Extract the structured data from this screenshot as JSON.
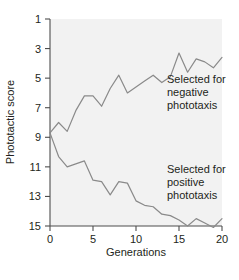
{
  "chart_data": {
    "type": "line",
    "title": "",
    "subtitle": "",
    "xlabel": "Generations",
    "ylabel": "Phototactic score",
    "xlim": [
      0,
      20
    ],
    "ylim": [
      1,
      15
    ],
    "y_axis_inverted": true,
    "grid": false,
    "legend_position": "inline-annotations",
    "xticks": [
      0,
      5,
      10,
      15,
      20
    ],
    "xticklabels": [
      "0",
      "5",
      "10",
      "15",
      "20"
    ],
    "yticks": [
      1,
      3,
      5,
      7,
      9,
      11,
      13,
      15
    ],
    "yticklabels": [
      "1",
      "3",
      "5",
      "7",
      "9",
      "11",
      "13",
      "15"
    ],
    "line_color": "#8a8a8a",
    "plot_background": "#f2f2f2",
    "x": [
      0,
      1,
      2,
      3,
      4,
      5,
      6,
      7,
      8,
      9,
      10,
      11,
      12,
      13,
      14,
      15,
      16,
      17,
      18,
      19,
      20
    ],
    "series": [
      {
        "name": "Selected for negative phototaxis",
        "values": [
          8.7,
          8.0,
          8.6,
          7.2,
          6.2,
          6.2,
          6.9,
          5.7,
          4.8,
          6.0,
          5.6,
          5.2,
          4.8,
          5.3,
          4.9,
          3.3,
          4.6,
          3.7,
          3.9,
          4.3,
          3.6
        ]
      },
      {
        "name": "Selected for positive phototaxis",
        "values": [
          8.7,
          10.3,
          11.0,
          10.8,
          10.6,
          11.9,
          12.0,
          12.9,
          12.0,
          12.1,
          13.3,
          13.6,
          13.7,
          14.2,
          14.3,
          14.6,
          15.0,
          14.5,
          14.8,
          15.1,
          14.5
        ]
      }
    ],
    "annotations": [
      {
        "id": "negative-annotation",
        "lines": [
          "Selected for",
          "negative",
          "phototaxis"
        ],
        "x_px": 167,
        "y_px": 83
      },
      {
        "id": "positive-annotation",
        "lines": [
          "Selected for",
          "positive",
          "phototaxis"
        ],
        "x_px": 167,
        "y_px": 173
      }
    ]
  }
}
